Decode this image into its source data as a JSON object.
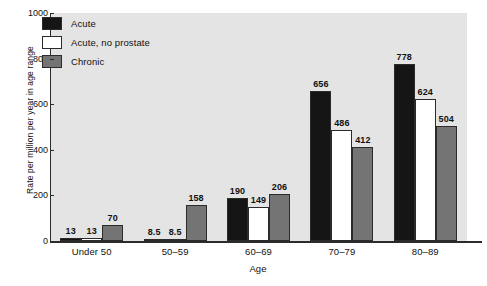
{
  "chart_data": {
    "type": "bar",
    "title": "",
    "xlabel": "Age",
    "ylabel": "Rate per million per year in age range",
    "ylim": [
      0,
      1000
    ],
    "yticks": [
      0,
      200,
      400,
      600,
      800,
      1000
    ],
    "ytick_labels": [
      "0",
      "200",
      "400",
      "600",
      "800",
      "1000"
    ],
    "grid": false,
    "legend_position": "upper-left-inside",
    "categories": [
      "Under 50",
      "50–59",
      "60–69",
      "70–79",
      "80–89"
    ],
    "series": [
      {
        "name": "Acute",
        "color": "#151515",
        "values": [
          13,
          8.5,
          190,
          656,
          778
        ],
        "labels": [
          "13",
          "8.5",
          "190",
          "656",
          "778"
        ]
      },
      {
        "name": "Acute, no prostate",
        "color": "#ffffff",
        "values": [
          13,
          8.5,
          149,
          486,
          624
        ],
        "labels": [
          "13",
          "8.5",
          "149",
          "486",
          "624"
        ]
      },
      {
        "name": "Chronic",
        "color": "#747474",
        "values": [
          70,
          158,
          206,
          412,
          504
        ],
        "labels": [
          "70",
          "158",
          "206",
          "412",
          "504"
        ]
      }
    ]
  },
  "legend": {
    "items": [
      {
        "label": "Acute",
        "swatch": "#151515"
      },
      {
        "label": "Acute, no prostate",
        "swatch": "#ffffff"
      },
      {
        "label": "Chronic",
        "swatch": "#747474"
      }
    ]
  },
  "style": {
    "plot_background": "#e4e4e4",
    "page_background": "#ffffff",
    "axis_color": "#2b2b2b",
    "text_color": "#111111"
  }
}
